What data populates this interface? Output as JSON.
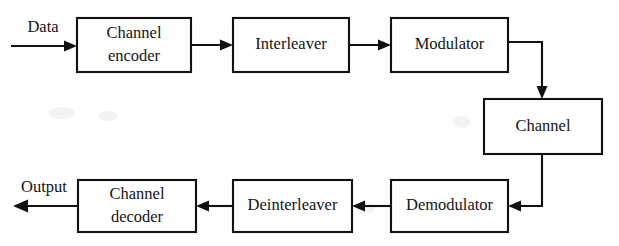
{
  "figure": {
    "kind": "block-diagram",
    "background_color": "#ffffff",
    "line_color": "#111111",
    "text_color": "#141414"
  },
  "io_labels": {
    "input": "Data",
    "output": "Output"
  },
  "blocks": [
    {
      "id": "channel-encoder",
      "lines": [
        "Channel",
        "encoder"
      ],
      "x": 77,
      "y": 18,
      "w": 114,
      "h": 54
    },
    {
      "id": "interleaver",
      "lines": [
        "Interleaver"
      ],
      "x": 233,
      "y": 18,
      "w": 116,
      "h": 54
    },
    {
      "id": "modulator",
      "lines": [
        "Modulator"
      ],
      "x": 391,
      "y": 18,
      "w": 117,
      "h": 54
    },
    {
      "id": "channel",
      "lines": [
        "Channel"
      ],
      "x": 484,
      "y": 99,
      "w": 118,
      "h": 55
    },
    {
      "id": "demodulator",
      "lines": [
        "Demodulator"
      ],
      "x": 391,
      "y": 180,
      "w": 117,
      "h": 52
    },
    {
      "id": "deinterleaver",
      "lines": [
        "Deinterleaver"
      ],
      "x": 233,
      "y": 180,
      "w": 119,
      "h": 52
    },
    {
      "id": "channel-decoder",
      "lines": [
        "Channel",
        "decoder"
      ],
      "x": 78,
      "y": 180,
      "w": 118,
      "h": 52
    }
  ],
  "connections": [
    {
      "id": "data-to-channel-encoder",
      "from": "Data",
      "to": "Channel encoder",
      "direction": "right"
    },
    {
      "id": "channel-encoder-to-interleaver",
      "from": "Channel encoder",
      "to": "Interleaver",
      "direction": "right"
    },
    {
      "id": "interleaver-to-modulator",
      "from": "Interleaver",
      "to": "Modulator",
      "direction": "right"
    },
    {
      "id": "modulator-to-channel",
      "from": "Modulator",
      "to": "Channel",
      "direction": "right-then-down"
    },
    {
      "id": "channel-to-demodulator",
      "from": "Channel",
      "to": "Demodulator",
      "direction": "down-then-left"
    },
    {
      "id": "demodulator-to-deinterleaver",
      "from": "Demodulator",
      "to": "Deinterleaver",
      "direction": "left"
    },
    {
      "id": "deinterleaver-to-channel-decoder",
      "from": "Deinterleaver",
      "to": "Channel decoder",
      "direction": "left"
    },
    {
      "id": "channel-decoder-to-output",
      "from": "Channel decoder",
      "to": "Output",
      "direction": "left"
    }
  ]
}
